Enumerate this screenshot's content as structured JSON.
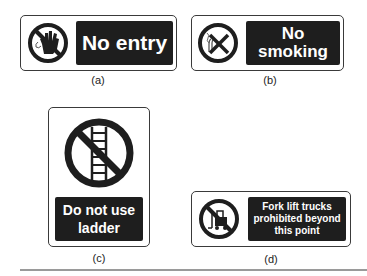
{
  "figure": {
    "signs": [
      {
        "id": "a",
        "text": "No entry",
        "caption": "(a)",
        "icon": "no-entry-hand-icon"
      },
      {
        "id": "b",
        "text_line1": "No",
        "text_line2": "smoking",
        "caption": "(b)",
        "icon": "no-smoking-icon"
      },
      {
        "id": "c",
        "text_line1": "Do not use",
        "text_line2": "ladder",
        "caption": "(c)",
        "icon": "no-ladder-icon"
      },
      {
        "id": "d",
        "text_line1": "Fork lift trucks",
        "text_line2": "prohibited beyond",
        "text_line3": "this point",
        "caption": "(d)",
        "icon": "no-forklift-icon"
      }
    ],
    "colors": {
      "panel": "#1e1e1e",
      "border": "#3a3a3a",
      "text": "#ffffff"
    }
  }
}
